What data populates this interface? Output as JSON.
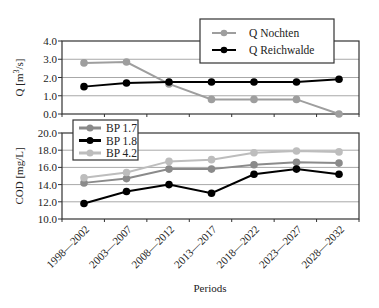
{
  "chart_data": [
    {
      "type": "line",
      "title": "",
      "xlabel": "",
      "ylabel": "Q [m³/s]",
      "ylabel_parts": {
        "base": "Q [m",
        "sup": "3",
        "tail": "/s]"
      },
      "ylim": [
        0.0,
        4.0
      ],
      "yticks": [
        "0.0",
        "1.0",
        "2.0",
        "3.0",
        "4.0"
      ],
      "grid": true,
      "legend_position": "top-right-overflow",
      "categories": [
        "1998—2002",
        "2003—2007",
        "2008—2012",
        "2013—2017",
        "2018—2022",
        "2023—2027",
        "2028—2032"
      ],
      "series": [
        {
          "name": "Q Nochten",
          "color": "#9e9e9e",
          "values": [
            2.8,
            2.85,
            1.65,
            0.8,
            0.8,
            0.8,
            0.0
          ]
        },
        {
          "name": "Q Reichwalde",
          "color": "#000000",
          "values": [
            1.5,
            1.7,
            1.75,
            1.75,
            1.75,
            1.75,
            1.9
          ]
        }
      ]
    },
    {
      "type": "line",
      "title": "",
      "xlabel": "Periods",
      "ylabel": "COD [mg/L]",
      "ylim": [
        10.0,
        20.0
      ],
      "yticks": [
        "10.0",
        "12.0",
        "14.0",
        "16.0",
        "18.0",
        "20.0"
      ],
      "grid": true,
      "legend_position": "top-left",
      "categories": [
        "1998—2002",
        "2003—2007",
        "2008—2012",
        "2013—2017",
        "2018—2022",
        "2023—2027",
        "2028—2032"
      ],
      "series": [
        {
          "name": "BP 1.7",
          "color": "#8a8a8a",
          "values": [
            14.2,
            14.7,
            15.8,
            15.8,
            16.3,
            16.6,
            16.5
          ]
        },
        {
          "name": "BP 1.8",
          "color": "#000000",
          "values": [
            11.8,
            13.2,
            14.0,
            13.0,
            15.2,
            15.8,
            15.2
          ]
        },
        {
          "name": "BP 4.2",
          "color": "#bdbdbd",
          "values": [
            14.8,
            15.4,
            16.7,
            16.9,
            17.7,
            17.9,
            17.8
          ]
        }
      ]
    }
  ]
}
